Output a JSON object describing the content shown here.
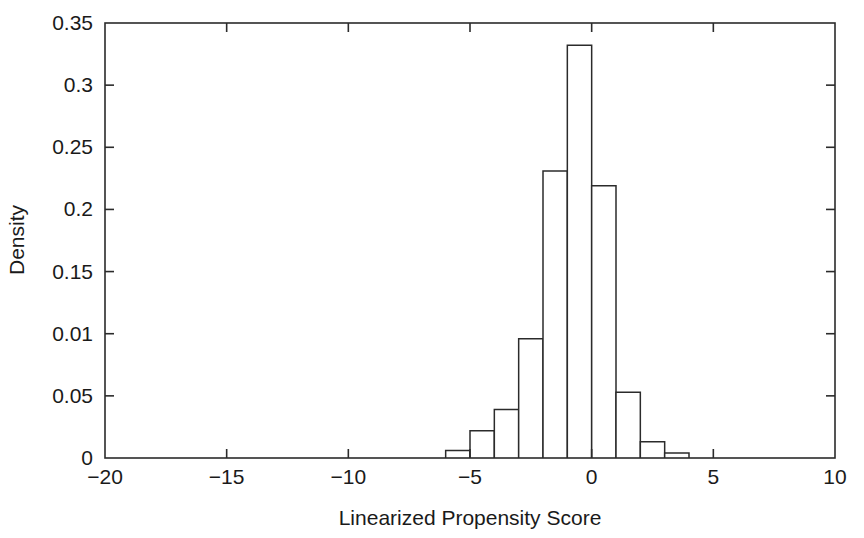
{
  "chart_data": {
    "type": "bar",
    "title": "",
    "subtitle": "",
    "xlabel": "Linearized Propensity Score",
    "ylabel": "Density",
    "xlim": [
      -20,
      10
    ],
    "ylim": [
      0,
      0.35
    ],
    "grid": false,
    "legend": null,
    "legend_position": "none",
    "bin_width": 1,
    "x_tick_labels": [
      "-20",
      "-15",
      "-10",
      "-5",
      "0",
      "5",
      "10"
    ],
    "x_tick_values": [
      -20,
      -15,
      -10,
      -5,
      0,
      5,
      10
    ],
    "y_tick_labels": [
      "0",
      "0.05",
      "0.01",
      "0.15",
      "0.2",
      "0.25",
      "0.3",
      "0.35"
    ],
    "y_tick_values": [
      0,
      0.05,
      0.1,
      0.15,
      0.2,
      0.25,
      0.3,
      0.35
    ],
    "bin_edges": [
      -6,
      -5,
      -4,
      -3,
      -2,
      -1,
      0,
      1,
      2,
      3,
      4
    ],
    "categories": [
      "-6 to -5",
      "-5 to -4",
      "-4 to -3",
      "-3 to -2",
      "-2 to -1",
      "-1 to 0",
      "0 to 1",
      "1 to 2",
      "2 to 3",
      "3 to 4"
    ],
    "values": [
      0.006,
      0.022,
      0.039,
      0.096,
      0.231,
      0.332,
      0.219,
      0.053,
      0.013,
      0.004
    ],
    "series": [
      {
        "name": "Density",
        "values": [
          0.006,
          0.022,
          0.039,
          0.096,
          0.231,
          0.332,
          0.219,
          0.053,
          0.013,
          0.004
        ]
      }
    ],
    "bar_fill_color": "#ffffff",
    "bar_edge_color": "#2b2b2b",
    "axis_color": "#2b2b2b",
    "background_color": "#ffffff"
  },
  "axis_titles": {
    "x": "Linearized Propensity Score",
    "y": "Density"
  },
  "y_ticks": [
    {
      "label": "0.35",
      "value": 0.35
    },
    {
      "label": "0.3",
      "value": 0.3
    },
    {
      "label": "0.25",
      "value": 0.25
    },
    {
      "label": "0.2",
      "value": 0.2
    },
    {
      "label": "0.15",
      "value": 0.15
    },
    {
      "label": "0.01",
      "value": 0.1
    },
    {
      "label": "0.05",
      "value": 0.05
    },
    {
      "label": "0",
      "value": 0
    }
  ],
  "x_ticks": [
    {
      "label": "-20",
      "value": -20
    },
    {
      "label": "-15",
      "value": -15
    },
    {
      "label": "-10",
      "value": -10
    },
    {
      "label": "-5",
      "value": -5
    },
    {
      "label": "0",
      "value": 0
    },
    {
      "label": "5",
      "value": 5
    },
    {
      "label": "10",
      "value": 10
    }
  ]
}
